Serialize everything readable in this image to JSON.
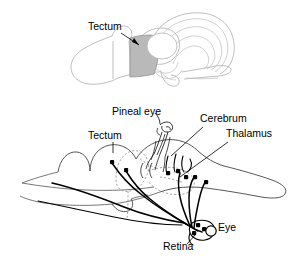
{
  "figure": {
    "background_color": "#ffffff",
    "ink_color": "#000000",
    "shade_color": "#b9b9b9",
    "faint_line_color": "#a9a9a9"
  },
  "panels": [
    {
      "id": "top-panel",
      "name": "dorsal-brain-view",
      "description": "Pale outline drawing of a brain with shaded tectum region",
      "labels": [
        {
          "key": "tectum_top",
          "text": "Tectum",
          "x": 88,
          "y": 30,
          "anchor": "start",
          "leader": "arrow to shaded tectum"
        }
      ]
    },
    {
      "id": "bottom-panel",
      "name": "sagittal-brain-section",
      "description": "Line drawing of sagittal brain section with retinal projections drawn as dark tracts terminating in filled cell bodies",
      "labels": [
        {
          "key": "pineal_eye",
          "text": "Pineal eye",
          "x": 112,
          "y": 115,
          "anchor": "start",
          "leader": "line to coiled pineal organ"
        },
        {
          "key": "cerebrum",
          "text": "Cerebrum",
          "x": 200,
          "y": 122,
          "anchor": "start",
          "leader": "line down-left to cerebrum"
        },
        {
          "key": "thalamus",
          "text": "Thalamus",
          "x": 226,
          "y": 137,
          "anchor": "start",
          "leader": "line down-left to thalamus"
        },
        {
          "key": "tectum_bottom",
          "text": "Tectum",
          "x": 88,
          "y": 139,
          "anchor": "start",
          "leader": "short tick down to tectum"
        },
        {
          "key": "retina",
          "text": "Retina",
          "x": 163,
          "y": 250,
          "anchor": "start",
          "leader": "line up-right to retina"
        },
        {
          "key": "eye",
          "text": "Eye",
          "x": 218,
          "y": 231,
          "anchor": "start",
          "leader": "none; adjacent to open circle eye"
        }
      ]
    }
  ]
}
